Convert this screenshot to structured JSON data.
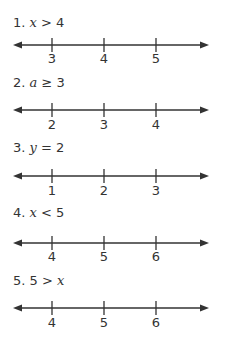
{
  "problems": [
    {
      "number": "1.",
      "variable": "x",
      "operator": ">",
      "value": "4",
      "ticks": [
        "3",
        "4",
        "5"
      ]
    },
    {
      "number": "2.",
      "variable": "a",
      "operator": "≥",
      "value": "3",
      "ticks": [
        "2",
        "3",
        "4"
      ]
    },
    {
      "number": "3.",
      "variable": "y",
      "operator": "=",
      "value": "2",
      "ticks": [
        "1",
        "2",
        "3"
      ]
    },
    {
      "number": "4.",
      "variable": "x",
      "operator": "<",
      "value": "5",
      "ticks": [
        "4",
        "5",
        "6"
      ]
    },
    {
      "number": "5.",
      "lhs": "5",
      "operator": ">",
      "variable": "x",
      "ticks": [
        "4",
        "5",
        "6"
      ]
    }
  ],
  "colors": {
    "line": "#333333",
    "text": "#333333",
    "background": "#ffffff"
  }
}
